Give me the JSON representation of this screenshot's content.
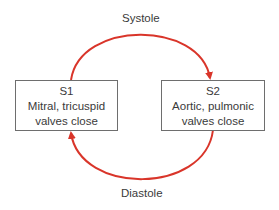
{
  "diagram": {
    "top_label": "Systole",
    "bottom_label": "Diastole",
    "arrow_color": "#d9352a",
    "nodes": [
      {
        "id": "S1",
        "title": "S1",
        "line1": "Mitral, tricuspid",
        "line2": "valves close"
      },
      {
        "id": "S2",
        "title": "S2",
        "line1": "Aortic, pulmonic",
        "line2": "valves close"
      }
    ],
    "edges": [
      {
        "from": "S1",
        "to": "S2",
        "label": "Systole"
      },
      {
        "from": "S2",
        "to": "S1",
        "label": "Diastole"
      }
    ]
  }
}
